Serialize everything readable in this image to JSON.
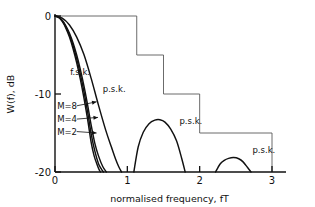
{
  "chart_data": {
    "type": "line",
    "title": "",
    "xlabel": "normalised frequency, fT",
    "ylabel": "W(f), dB",
    "xlim": [
      0,
      3.18
    ],
    "ylim": [
      -20,
      0
    ],
    "grid": false,
    "legend_position": "inline-annotations",
    "x_ticks": [
      "0",
      "1",
      "2",
      "3"
    ],
    "x_tick_values": [
      0,
      1,
      2,
      3
    ],
    "y_ticks": [
      "0",
      "-10",
      "-20"
    ],
    "y_tick_values": [
      0,
      -10,
      -20
    ],
    "series": [
      {
        "name": "f.s.k. M=2",
        "label": "M=2",
        "x": [
          0,
          0.05,
          0.1,
          0.15,
          0.2,
          0.25,
          0.3,
          0.35,
          0.4,
          0.45,
          0.5,
          0.54,
          0.58,
          0.61,
          0.63
        ],
        "values": [
          0,
          -0.18,
          -0.7,
          -1.55,
          -2.7,
          -4.2,
          -6.0,
          -8.1,
          -10.5,
          -13.2,
          -16.2,
          -17.9,
          -19.0,
          -19.7,
          -20
        ]
      },
      {
        "name": "f.s.k. M=4",
        "label": "M=4",
        "x": [
          0,
          0.05,
          0.1,
          0.15,
          0.2,
          0.25,
          0.3,
          0.35,
          0.4,
          0.45,
          0.5,
          0.55,
          0.6,
          0.64,
          0.67
        ],
        "values": [
          0,
          -0.16,
          -0.62,
          -1.4,
          -2.45,
          -3.8,
          -5.5,
          -7.45,
          -9.7,
          -12.25,
          -15.1,
          -17.3,
          -18.9,
          -19.6,
          -20
        ]
      },
      {
        "name": "f.s.k. M=8",
        "label": "M=8",
        "x": [
          0,
          0.05,
          0.1,
          0.15,
          0.2,
          0.25,
          0.3,
          0.35,
          0.4,
          0.45,
          0.5,
          0.55,
          0.6,
          0.66,
          0.71
        ],
        "values": [
          0,
          -0.14,
          -0.55,
          -1.25,
          -2.2,
          -3.45,
          -5.0,
          -6.85,
          -8.95,
          -11.35,
          -14.0,
          -16.3,
          -17.9,
          -19.3,
          -20
        ]
      },
      {
        "name": "p.s.k. main lobe",
        "label": "p.s.k.",
        "x": [
          0,
          0.1,
          0.2,
          0.3,
          0.4,
          0.5,
          0.6,
          0.7,
          0.78,
          0.84,
          0.88,
          0.92
        ],
        "values": [
          0,
          -0.28,
          -1.15,
          -2.7,
          -4.95,
          -8.0,
          -11.4,
          -14.6,
          -16.8,
          -18.4,
          -19.3,
          -20
        ]
      },
      {
        "name": "p.s.k. first sidelobe",
        "label": "p.s.k.",
        "x": [
          1.09,
          1.15,
          1.22,
          1.3,
          1.38,
          1.45,
          1.52,
          1.6,
          1.68,
          1.75,
          1.8
        ],
        "values": [
          -20,
          -16.8,
          -14.9,
          -13.8,
          -13.35,
          -13.3,
          -13.6,
          -14.5,
          -16.0,
          -18.2,
          -20
        ]
      },
      {
        "name": "p.s.k. second sidelobe",
        "label": "p.s.k.",
        "x": [
          2.22,
          2.28,
          2.34,
          2.4,
          2.47,
          2.54,
          2.6,
          2.66,
          2.71
        ],
        "values": [
          -20,
          -19.0,
          -18.5,
          -18.25,
          -18.15,
          -18.3,
          -18.7,
          -19.4,
          -20
        ]
      }
    ],
    "mask_steps": {
      "name": "out-of-band emission mask",
      "corners_x": [
        0.0,
        1.13,
        1.13,
        1.5,
        1.5,
        2.0,
        2.0,
        3.0,
        3.0
      ],
      "corners_y": [
        0.0,
        0.0,
        -5.0,
        -5.0,
        -10.0,
        -10.0,
        -15.0,
        -15.0,
        -20.0
      ]
    },
    "annotations": [
      {
        "id": "fsk-group-label",
        "text": "f.s.k.",
        "x": 0.21,
        "y": -7.5
      },
      {
        "id": "psk-main-label",
        "text": "p.s.k.",
        "x": 0.66,
        "y": -9.8
      },
      {
        "id": "psk-lobe1-label",
        "text": "p.s.k.",
        "x": 1.72,
        "y": -13.9
      },
      {
        "id": "psk-lobe2-label",
        "text": "p.s.k.",
        "x": 2.73,
        "y": -17.6
      },
      {
        "id": "m8-label",
        "text": "M=8",
        "x": 0.03,
        "y": -11.9
      },
      {
        "id": "m4-label",
        "text": "M=4",
        "x": 0.03,
        "y": -13.6
      },
      {
        "id": "m2-label",
        "text": "M=2",
        "x": 0.03,
        "y": -15.2
      }
    ]
  },
  "axes": {
    "y_title": "W(f), dB",
    "x_title": "normalised frequency, fT",
    "x_tick_labels": [
      "0",
      "1",
      "2",
      "3"
    ],
    "y_tick_labels": [
      "0",
      "-10",
      "-20"
    ]
  },
  "labels": {
    "fsk": "f.s.k.",
    "psk_main": "p.s.k.",
    "psk_lobe1": "p.s.k.",
    "psk_lobe2": "p.s.k.",
    "m8": "M=8",
    "m4": "M=4",
    "m2": "M=2"
  },
  "colors": {
    "curve": "#111111",
    "mask": "#5a5a5a",
    "axis": "#111111",
    "background": "#ffffff"
  }
}
